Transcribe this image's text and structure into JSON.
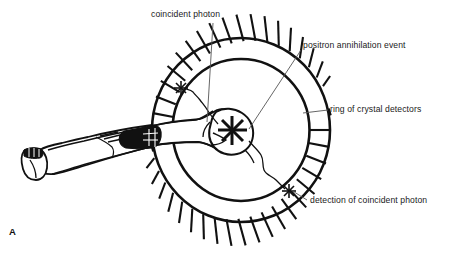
{
  "figure": {
    "panel_letter": "A",
    "caption_labels": [
      {
        "id": "coincident-photon",
        "text": "coincident photon"
      },
      {
        "id": "positron-annihilation-event",
        "text": "positron annihilation event"
      },
      {
        "id": "ring-of-crystal-detectors",
        "text": "ring of crystal detectors"
      },
      {
        "id": "detection-of-coincident-photon",
        "text": "detection of coincident photon"
      }
    ],
    "colors": {
      "ink": "#111111",
      "background": "#ffffff",
      "shading": "#000000"
    },
    "diagram": {
      "subject": "reclining patient inside PET detector ring",
      "detector_segment_count": 34,
      "starburst_markers": [
        {
          "id": "annihilation-starburst",
          "label": "positron annihilation event",
          "cx": 232,
          "cy": 130,
          "size": 15
        },
        {
          "id": "upper-left-detection-starburst",
          "label": "coincident photon detection",
          "cx": 181,
          "cy": 88,
          "size": 7
        },
        {
          "id": "lower-right-detection-starburst",
          "label": "detection of coincident photon",
          "cx": 289,
          "cy": 191,
          "size": 7
        }
      ],
      "ring": {
        "cx": 241,
        "cy": 130,
        "outer_rx": 89,
        "outer_ry": 92,
        "inner_rx": 68,
        "inner_ry": 71
      }
    }
  }
}
